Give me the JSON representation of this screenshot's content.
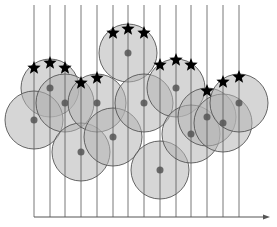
{
  "diagram": {
    "width": 277,
    "height": 227,
    "colors": {
      "circle_fill": "#b4b4b4",
      "circle_stroke": "#555555",
      "center_dot": "#555555",
      "line": "#555555",
      "star": "#000000"
    },
    "vertical_lines_x": [
      34,
      50,
      65,
      81,
      97,
      113,
      128,
      144,
      160,
      176,
      191,
      207,
      223,
      239
    ],
    "line_top_y": 5,
    "axis": {
      "x1": 34,
      "x2": 270,
      "y": 217
    },
    "radius": 29,
    "circles": [
      {
        "cx": 50,
        "cy": 88
      },
      {
        "cx": 34,
        "cy": 120
      },
      {
        "cx": 65,
        "cy": 103
      },
      {
        "cx": 81,
        "cy": 152
      },
      {
        "cx": 97,
        "cy": 103
      },
      {
        "cx": 113,
        "cy": 137
      },
      {
        "cx": 128,
        "cy": 53
      },
      {
        "cx": 144,
        "cy": 103
      },
      {
        "cx": 160,
        "cy": 170
      },
      {
        "cx": 176,
        "cy": 88
      },
      {
        "cx": 191,
        "cy": 134
      },
      {
        "cx": 207,
        "cy": 117
      },
      {
        "cx": 223,
        "cy": 123
      },
      {
        "cx": 239,
        "cy": 103
      }
    ],
    "stars": [
      {
        "x": 34,
        "y": 68
      },
      {
        "x": 50,
        "y": 63
      },
      {
        "x": 65,
        "y": 68
      },
      {
        "x": 81,
        "y": 83
      },
      {
        "x": 97,
        "y": 78
      },
      {
        "x": 113,
        "y": 33
      },
      {
        "x": 128,
        "y": 29
      },
      {
        "x": 144,
        "y": 33
      },
      {
        "x": 160,
        "y": 65
      },
      {
        "x": 176,
        "y": 60
      },
      {
        "x": 191,
        "y": 65
      },
      {
        "x": 207,
        "y": 91
      },
      {
        "x": 223,
        "y": 82
      },
      {
        "x": 239,
        "y": 77
      }
    ]
  }
}
